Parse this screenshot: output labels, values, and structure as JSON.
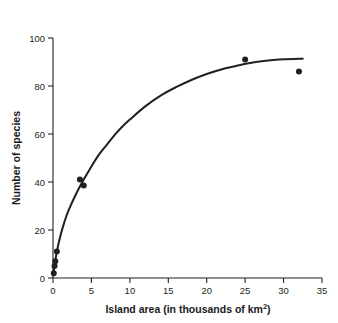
{
  "figure": {
    "background_color": "#ffffff",
    "ink_color": "#231f20"
  },
  "chart_data": {
    "type": "scatter",
    "title": "",
    "subtitle": "",
    "xlabel": "Island area (in thousands of km",
    "xlabel_superscript": "2",
    "xlabel_suffix": ")",
    "xlabel_full": "Island area (in thousands of km2)",
    "ylabel": "Number of species",
    "xlim": [
      0,
      35
    ],
    "ylim": [
      0,
      100
    ],
    "xticks": [
      0,
      5,
      10,
      15,
      20,
      25,
      30,
      35
    ],
    "xtick_labels": [
      "0",
      "5",
      "10",
      "15",
      "20",
      "25",
      "30",
      "35"
    ],
    "yticks": [
      0,
      20,
      40,
      60,
      80,
      100
    ],
    "ytick_labels": [
      "0",
      "20",
      "40",
      "60",
      "80",
      "100"
    ],
    "grid": false,
    "legend": false,
    "legend_position": "none",
    "marker_color": "#231f20",
    "marker_shape": "circle",
    "marker_size": 3,
    "points": [
      {
        "x": 0.1,
        "y": 2
      },
      {
        "x": 0.2,
        "y": 5
      },
      {
        "x": 0.3,
        "y": 7
      },
      {
        "x": 0.5,
        "y": 11
      },
      {
        "x": 3.5,
        "y": 41
      },
      {
        "x": 4.0,
        "y": 38.5
      },
      {
        "x": 25.0,
        "y": 91
      },
      {
        "x": 32.0,
        "y": 86
      }
    ],
    "series": [
      {
        "name": "Fitted species-area curve",
        "type": "line",
        "color": "#231f20",
        "line_width": 2,
        "x": [
          0,
          0.5,
          1,
          1.5,
          2,
          3,
          4,
          5,
          6,
          7,
          8,
          9,
          10,
          12,
          14,
          16,
          18,
          20,
          22,
          24,
          26,
          28,
          30,
          32.5
        ],
        "y": [
          1,
          11,
          18,
          23.5,
          28,
          35,
          41,
          46.5,
          51.5,
          55.5,
          59.5,
          63,
          66,
          71.5,
          76,
          79.5,
          82.5,
          85,
          87,
          88.5,
          89.8,
          90.6,
          91.1,
          91.4
        ]
      }
    ]
  }
}
